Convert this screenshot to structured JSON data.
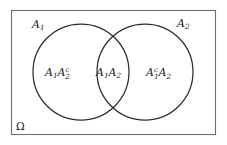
{
  "figure": {
    "name": "venn-diagram-two-sets",
    "type": "set-diagram"
  },
  "colors": {
    "stroke": "#2b2b2b",
    "frame_stroke": "#6f6f6f",
    "text": "#1c1c1c",
    "background": "#ffffff"
  },
  "sample_space": {
    "symbol": "Ω",
    "label_position": "bottom-left"
  },
  "set_labels": {
    "left_circle": {
      "base": "A",
      "sub": "1",
      "sup": ""
    },
    "right_circle": {
      "base": "A",
      "sub": "2",
      "sup": ""
    }
  },
  "regions": [
    {
      "id": "left-only",
      "terms": [
        {
          "base": "A",
          "sub": "1",
          "sup": ""
        },
        {
          "base": "A",
          "sub": "2",
          "sup": "c"
        }
      ],
      "plain": "A1A2c"
    },
    {
      "id": "intersection",
      "terms": [
        {
          "base": "A",
          "sub": "1",
          "sup": ""
        },
        {
          "base": "A",
          "sub": "2",
          "sup": ""
        }
      ],
      "plain": "A1A2"
    },
    {
      "id": "right-only",
      "terms": [
        {
          "base": "A",
          "sub": "1",
          "sup": "c"
        },
        {
          "base": "A",
          "sub": "2",
          "sup": ""
        }
      ],
      "plain": "A1cA2"
    }
  ],
  "geometry": {
    "frame": {
      "x": 11,
      "y": 10,
      "width": 205,
      "height": 125
    },
    "left_circle": {
      "cx": 81,
      "cy": 72,
      "r": 48
    },
    "right_circle": {
      "cx": 145,
      "cy": 72,
      "r": 48
    }
  }
}
